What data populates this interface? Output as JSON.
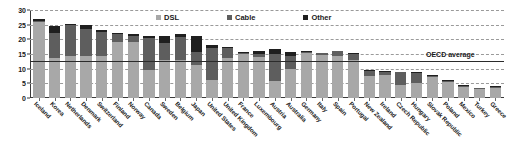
{
  "chart_data": {
    "type": "bar",
    "stacked": true,
    "title": "",
    "subtitle": "",
    "xlabel": "",
    "ylabel": "",
    "ylim": [
      0,
      30
    ],
    "yticks": [
      0,
      5,
      10,
      15,
      20,
      25,
      30
    ],
    "grid": true,
    "legend_position": "top-center",
    "categories": [
      "Iceland",
      "Korea",
      "Netherlands",
      "Denmark",
      "Switzerland",
      "Finland",
      "Norway",
      "Canada",
      "Sweden",
      "Belgium",
      "Japan",
      "United States",
      "United Kingdom",
      "France",
      "Luxembourg",
      "Austria",
      "Australia",
      "Germany",
      "Italy",
      "Spain",
      "Portugal",
      "New Zealand",
      "Ireland",
      "Czech Republic",
      "Hungary",
      "Slovak Republic",
      "Poland",
      "Mexico",
      "Turkey",
      "Greece"
    ],
    "series": [
      {
        "name": "DSL",
        "color": "#a8a8a8",
        "values": [
          25.9,
          13.7,
          14.2,
          14.4,
          14.4,
          19.0,
          19.2,
          9.6,
          12.9,
          13.0,
          11.1,
          6.2,
          13.7,
          14.9,
          14.1,
          5.9,
          9.9,
          15.3,
          14.7,
          14.3,
          13.1,
          7.4,
          8.0,
          4.3,
          5.1,
          7.1,
          5.5,
          3.6,
          3.0,
          3.5
        ]
      },
      {
        "name": "Cable",
        "color": "#5e5e5e",
        "values": [
          0.4,
          8.3,
          10.8,
          9.3,
          8.0,
          2.7,
          2.0,
          11.0,
          6.0,
          7.9,
          4.6,
          11.0,
          3.5,
          0.4,
          0.9,
          9.1,
          4.4,
          0.2,
          0.5,
          1.6,
          2.0,
          1.8,
          0.9,
          4.4,
          3.5,
          0.5,
          0.3,
          0.5,
          0.2,
          0.1
        ]
      },
      {
        "name": "Other",
        "color": "#1f1f1f",
        "values": [
          0.6,
          2.6,
          0.2,
          1.2,
          0.7,
          0.5,
          0.5,
          0.4,
          2.1,
          0.8,
          5.3,
          1.0,
          0.3,
          0.2,
          0.9,
          1.6,
          1.5,
          0.3,
          0.3,
          0.2,
          0.2,
          0.2,
          0.4,
          0.3,
          0.4,
          0.2,
          0.2,
          0.1,
          0.1,
          0.1
        ]
      }
    ],
    "reference_line": {
      "label": "OECD average",
      "value": 12.7,
      "color": "#2b2b2b"
    }
  },
  "legend": {
    "items": [
      {
        "label": "DSL",
        "color": "#a8a8a8"
      },
      {
        "label": "Cable",
        "color": "#5e5e5e"
      },
      {
        "label": "Other",
        "color": "#1f1f1f"
      }
    ]
  }
}
